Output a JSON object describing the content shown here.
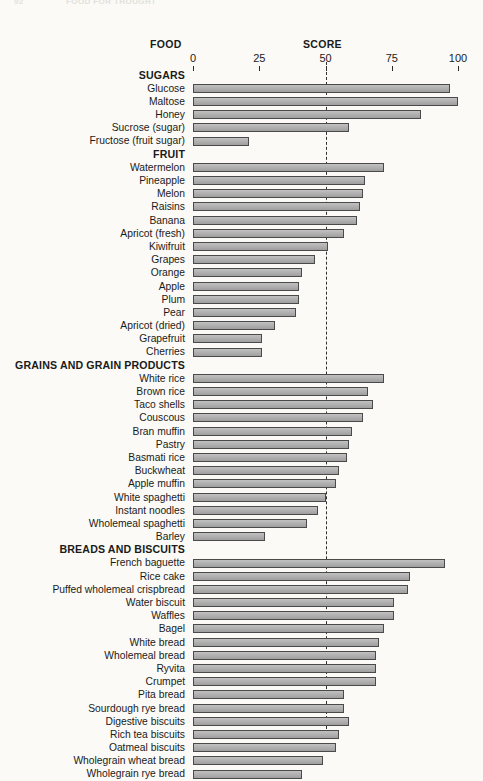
{
  "running_head": {
    "folio": "92",
    "title": "FOOD FOR THOUGHT"
  },
  "headers": {
    "food": "FOOD",
    "score": "SCORE"
  },
  "axis": {
    "ticks": [
      0,
      25,
      50,
      75,
      100
    ],
    "reference_line_value": 50
  },
  "chart_data": {
    "type": "bar",
    "orientation": "horizontal",
    "title": "",
    "xlabel": "SCORE",
    "ylabel": "FOOD",
    "xlim": [
      0,
      100
    ],
    "xticks": [
      0,
      25,
      50,
      75,
      100
    ],
    "grid": false,
    "legend": "none",
    "annotations": [
      "dashed vertical reference line at 50"
    ],
    "bar_color": "#a9a9a9",
    "bar_edge_color": "#4a4a4a",
    "groups": [
      {
        "name": "SUGARS",
        "items": [
          {
            "label": "Glucose",
            "value": 97
          },
          {
            "label": "Maltose",
            "value": 100
          },
          {
            "label": "Honey",
            "value": 86
          },
          {
            "label": "Sucrose (sugar)",
            "value": 59
          },
          {
            "label": "Fructose (fruit sugar)",
            "value": 21
          }
        ]
      },
      {
        "name": "FRUIT",
        "items": [
          {
            "label": "Watermelon",
            "value": 72
          },
          {
            "label": "Pineapple",
            "value": 65
          },
          {
            "label": "Melon",
            "value": 64
          },
          {
            "label": "Raisins",
            "value": 63
          },
          {
            "label": "Banana",
            "value": 62
          },
          {
            "label": "Apricot (fresh)",
            "value": 57
          },
          {
            "label": "Kiwifruit",
            "value": 51
          },
          {
            "label": "Grapes",
            "value": 46
          },
          {
            "label": "Orange",
            "value": 41
          },
          {
            "label": "Apple",
            "value": 40
          },
          {
            "label": "Plum",
            "value": 40
          },
          {
            "label": "Pear",
            "value": 39
          },
          {
            "label": "Apricot (dried)",
            "value": 31
          },
          {
            "label": "Grapefruit",
            "value": 26
          },
          {
            "label": "Cherries",
            "value": 26
          }
        ]
      },
      {
        "name": "GRAINS AND GRAIN PRODUCTS",
        "items": [
          {
            "label": "White rice",
            "value": 72
          },
          {
            "label": "Brown rice",
            "value": 66
          },
          {
            "label": "Taco shells",
            "value": 68
          },
          {
            "label": "Couscous",
            "value": 64
          },
          {
            "label": "Bran muffin",
            "value": 60
          },
          {
            "label": "Pastry",
            "value": 59
          },
          {
            "label": "Basmati rice",
            "value": 58
          },
          {
            "label": "Buckwheat",
            "value": 55
          },
          {
            "label": "Apple muffin",
            "value": 54
          },
          {
            "label": "White spaghetti",
            "value": 50
          },
          {
            "label": "Instant noodles",
            "value": 47
          },
          {
            "label": "Wholemeal spaghetti",
            "value": 43
          },
          {
            "label": "Barley",
            "value": 27
          }
        ]
      },
      {
        "name": "BREADS AND BISCUITS",
        "items": [
          {
            "label": "French baguette",
            "value": 95
          },
          {
            "label": "Rice cake",
            "value": 82
          },
          {
            "label": "Puffed wholemeal crispbread",
            "value": 81
          },
          {
            "label": "Water biscuit",
            "value": 76
          },
          {
            "label": "Waffles",
            "value": 76
          },
          {
            "label": "Bagel",
            "value": 72
          },
          {
            "label": "White bread",
            "value": 70
          },
          {
            "label": "Wholemeal bread",
            "value": 69
          },
          {
            "label": "Ryvita",
            "value": 69
          },
          {
            "label": "Crumpet",
            "value": 69
          },
          {
            "label": "Pita bread",
            "value": 57
          },
          {
            "label": "Sourdough rye bread",
            "value": 57
          },
          {
            "label": "Digestive biscuits",
            "value": 59
          },
          {
            "label": "Rich tea biscuits",
            "value": 55
          },
          {
            "label": "Oatmeal biscuits",
            "value": 54
          },
          {
            "label": "Wholegrain wheat bread",
            "value": 49
          },
          {
            "label": "Wholegrain rye bread",
            "value": 41
          }
        ]
      }
    ]
  }
}
